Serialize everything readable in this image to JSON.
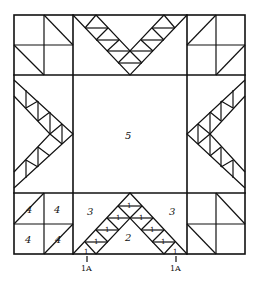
{
  "diagram": {
    "type": "quilt-block-piecing-diagram",
    "stroke_color": "#111111",
    "background": "#ffffff",
    "labels": {
      "center": "5",
      "bottom_center_triangle": "2",
      "bottom_left_triangle": "3",
      "bottom_right_triangle": "3",
      "corner_piece": "4",
      "chevron_piece": "1",
      "edge_piece_left": "1A",
      "edge_piece_right": "1A"
    },
    "corner_labels": [
      "4",
      "4",
      "4",
      "4"
    ],
    "chevron_piece_labels": [
      "1",
      "1",
      "1",
      "1",
      "1",
      "1",
      "1",
      "1",
      "1"
    ]
  }
}
